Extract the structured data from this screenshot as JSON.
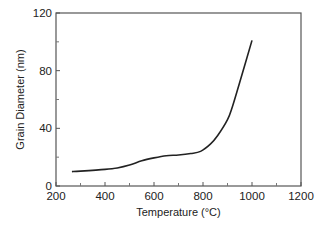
{
  "chart_data": {
    "type": "line",
    "title": "",
    "xlabel": "Temperature (°C)",
    "ylabel": "Grain Diameter (nm)",
    "xlim": [
      200,
      1200
    ],
    "ylim": [
      0,
      120
    ],
    "x_ticks": [
      200,
      400,
      600,
      800,
      1000,
      1200
    ],
    "x_minor_ticks": [
      300,
      500,
      700,
      900,
      1100
    ],
    "y_ticks": [
      0,
      40,
      80,
      120
    ],
    "y_minor_ticks": [
      20,
      60,
      100
    ],
    "grid": false,
    "legend": null,
    "series": [
      {
        "name": "Grain Diameter",
        "color": "#222222",
        "x": [
          265,
          300,
          400,
          450,
          500,
          550,
          600,
          650,
          700,
          750,
          790,
          830,
          860,
          900,
          920,
          950,
          1000
        ],
        "y": [
          10,
          10.3,
          11.5,
          12.5,
          14.5,
          17.5,
          19.5,
          21,
          21.5,
          22.5,
          24,
          29,
          35,
          46,
          55,
          72,
          101
        ]
      }
    ]
  }
}
